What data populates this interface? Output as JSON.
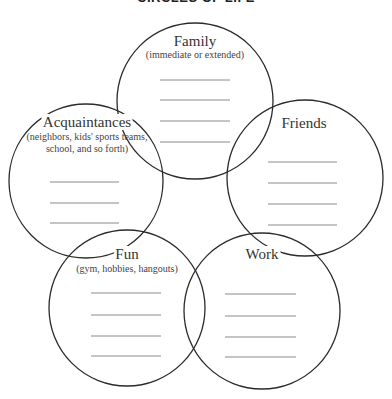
{
  "title": "CIRCLES OF LIFE",
  "colors": {
    "circle_stroke": "#2b2b2b",
    "line_stroke": "#8a8a8a",
    "text": "#333333"
  },
  "circles": [
    {
      "id": "family",
      "name": "Family",
      "subtitle": [
        "(immediate or extended)"
      ],
      "cx": 195,
      "cy": 101,
      "r": 78,
      "lines": 4
    },
    {
      "id": "acquaintances",
      "name": "Acquaintances",
      "subtitle": [
        "(neighbors, kids' sports teams,",
        "school, and so forth)"
      ],
      "cx": 86,
      "cy": 181,
      "r": 77,
      "lines": 3
    },
    {
      "id": "friends",
      "name": "Friends",
      "subtitle": [],
      "cx": 305,
      "cy": 178,
      "r": 78,
      "lines": 4
    },
    {
      "id": "fun",
      "name": "Fun",
      "subtitle": [
        "(gym, hobbies, hangouts)"
      ],
      "cx": 127,
      "cy": 308,
      "r": 78,
      "lines": 4
    },
    {
      "id": "work",
      "name": "Work",
      "subtitle": [],
      "cx": 262,
      "cy": 311,
      "r": 78,
      "lines": 4
    }
  ],
  "labels": {
    "family": {
      "name": "Family",
      "sub1": "(immediate or extended)"
    },
    "acquaintances": {
      "name": "Acquaintances",
      "sub1": "(neighbors, kids' sports teams,",
      "sub2": "school, and so forth)"
    },
    "friends": {
      "name": "Friends"
    },
    "fun": {
      "name": "Fun",
      "sub1": "(gym, hobbies, hangouts)"
    },
    "work": {
      "name": "Work"
    }
  }
}
